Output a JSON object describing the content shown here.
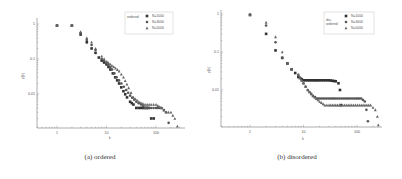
{
  "chart_data": [
    {
      "type": "scatter",
      "panel": "a",
      "caption": "(a) ordered",
      "xlabel": "k",
      "ylabel": "p(k)",
      "xscale": "log",
      "yscale": "log",
      "xlim": [
        0.4,
        300
      ],
      "ylim": [
        0.001,
        1.3
      ],
      "xticks": [
        "1",
        "10",
        "100"
      ],
      "yticks": [
        "1",
        "0.1",
        "0.01"
      ],
      "legend": {
        "title": "ordered",
        "position": "upper right",
        "entries": [
          "N=1000",
          "N=3000",
          "N=5000"
        ]
      },
      "series": [
        {
          "name": "N=1000",
          "marker": "square",
          "x": [
            1,
            2,
            3,
            4,
            5,
            6,
            7,
            8,
            10,
            12,
            15,
            18,
            22,
            26,
            30,
            35,
            40,
            50,
            60,
            70,
            80,
            90
          ],
          "y": [
            0.9,
            0.9,
            0.5,
            0.3,
            0.2,
            0.15,
            0.11,
            0.09,
            0.07,
            0.05,
            0.03,
            0.02,
            0.012,
            0.008,
            0.006,
            0.005,
            0.004,
            0.004,
            0.004,
            0.004,
            0.002,
            0.002
          ]
        },
        {
          "name": "N=3000",
          "marker": "circle",
          "x": [
            1,
            2,
            3,
            4,
            5,
            6,
            8,
            10,
            13,
            16,
            20,
            25,
            30,
            40,
            50,
            60,
            80,
            100,
            130,
            160,
            180
          ],
          "y": [
            0.9,
            0.9,
            0.55,
            0.35,
            0.25,
            0.18,
            0.1,
            0.08,
            0.05,
            0.03,
            0.02,
            0.013,
            0.009,
            0.006,
            0.005,
            0.004,
            0.004,
            0.004,
            0.004,
            0.003,
            0.0015
          ]
        },
        {
          "name": "N=5000",
          "marker": "triangle",
          "x": [
            1,
            2,
            3,
            4,
            5,
            6,
            8,
            10,
            14,
            18,
            22,
            28,
            35,
            45,
            60,
            80,
            100,
            130,
            160,
            200,
            240,
            270
          ],
          "y": [
            0.9,
            0.9,
            0.6,
            0.4,
            0.3,
            0.2,
            0.12,
            0.085,
            0.06,
            0.045,
            0.03,
            0.015,
            0.008,
            0.006,
            0.005,
            0.005,
            0.005,
            0.004,
            0.003,
            0.003,
            0.002,
            0.0012
          ]
        }
      ]
    },
    {
      "type": "scatter",
      "panel": "b",
      "caption": "(b) disordered",
      "xlabel": "k",
      "ylabel": "p(k)",
      "xscale": "log",
      "yscale": "log",
      "xlim": [
        0.4,
        300
      ],
      "ylim": [
        0.001,
        1.3
      ],
      "xticks": [
        "1",
        "10",
        "100"
      ],
      "yticks": [
        "1",
        "0.1",
        "0.01"
      ],
      "legend": {
        "title": "dis-ordered",
        "position": "upper right",
        "entries": [
          "N=1000",
          "N=3000",
          "N=5000"
        ]
      },
      "series": [
        {
          "name": "N=1000",
          "marker": "square",
          "x": [
            1,
            2,
            3,
            4,
            5,
            6,
            7,
            8,
            10,
            15,
            20,
            30,
            40,
            45,
            48,
            50
          ],
          "y": [
            0.95,
            0.3,
            0.11,
            0.07,
            0.05,
            0.035,
            0.028,
            0.022,
            0.018,
            0.018,
            0.018,
            0.018,
            0.017,
            0.015,
            0.01,
            0.004
          ]
        },
        {
          "name": "N=3000",
          "marker": "circle",
          "x": [
            1,
            2,
            3,
            4,
            5,
            6,
            8,
            10,
            12,
            15,
            18,
            25,
            40,
            60,
            90,
            120,
            140,
            150,
            160
          ],
          "y": [
            0.95,
            0.5,
            0.18,
            0.07,
            0.05,
            0.035,
            0.025,
            0.015,
            0.01,
            0.007,
            0.006,
            0.006,
            0.006,
            0.006,
            0.006,
            0.006,
            0.005,
            0.003,
            0.0015
          ]
        },
        {
          "name": "N=5000",
          "marker": "triangle",
          "x": [
            1,
            2,
            3,
            4,
            5,
            6,
            8,
            10,
            12,
            15,
            20,
            25,
            30,
            50,
            80,
            120,
            180,
            220,
            240,
            250
          ],
          "y": [
            0.95,
            0.6,
            0.25,
            0.1,
            0.05,
            0.035,
            0.025,
            0.015,
            0.01,
            0.007,
            0.005,
            0.004,
            0.004,
            0.004,
            0.004,
            0.004,
            0.004,
            0.003,
            0.002,
            0.0012
          ]
        }
      ]
    }
  ],
  "figure": {
    "panels": [
      {
        "caption": "(a) ordered",
        "xlabel": "k",
        "ylabel": "p(k)",
        "legend_title": "ordered",
        "legend_entries": [
          "N=1000",
          "N=3000",
          "N=5000"
        ],
        "xticks": [
          "1",
          "10",
          "100"
        ],
        "yticks": [
          "1",
          "0.1",
          "0.01"
        ]
      },
      {
        "caption": "(b) disordered",
        "xlabel": "k",
        "ylabel": "p(k)",
        "legend_title_line1": "dis-",
        "legend_title_line2": "ordered",
        "legend_entries": [
          "N=1000",
          "N=3000",
          "N=5000"
        ],
        "xticks": [
          "1",
          "10",
          "100"
        ],
        "yticks": [
          "1",
          "0.1",
          "0.01"
        ]
      }
    ],
    "colors": {
      "axis": "#777777",
      "markers": "#333333",
      "text": "#333333"
    }
  }
}
